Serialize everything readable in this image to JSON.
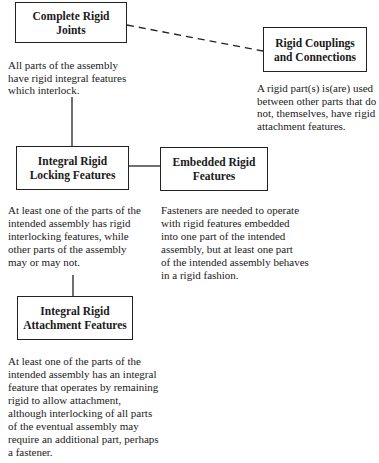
{
  "diagram": {
    "nodes": [
      {
        "id": "complete-rigid-joints",
        "title": "Complete Rigid\nJoints",
        "description": "All parts of the assembly\nhave rigid integral features\nwhich interlock."
      },
      {
        "id": "rigid-couplings-connections",
        "title": "Rigid Couplings\nand Connections",
        "description": "A rigid part(s) is(are) used\nbetween other parts that do\nnot, themselves, have rigid\nattachment features."
      },
      {
        "id": "integral-rigid-locking-features",
        "title": "Integral Rigid\nLocking Features",
        "description": "At least one of the parts of the\nintended assembly has rigid\ninterlocking features, while\nother parts of the assembly\nmay or may not."
      },
      {
        "id": "embedded-rigid-features",
        "title": "Embedded Rigid\nFeatures",
        "description": "Fasteners are needed to operate\nwith rigid features embedded\ninto one part of the intended\nassembly, but at least one part\nof the intended assembly behaves\nin a rigid fashion."
      },
      {
        "id": "integral-rigid-attachment-features",
        "title": "Integral Rigid\nAttachment Features",
        "description": "At least one of the parts of the\nintended assembly has an integral\nfeature that operates by remaining\nrigid to allow attachment,\nalthough interlocking of all parts\nof the eventual assembly may\nrequire an additional part, perhaps\na fastener."
      }
    ],
    "edges": [
      {
        "from": "complete-rigid-joints",
        "to": "rigid-couplings-connections",
        "style": "dashed"
      },
      {
        "from": "complete-rigid-joints",
        "to": "integral-rigid-locking-features",
        "style": "solid"
      },
      {
        "from": "integral-rigid-locking-features",
        "to": "embedded-rigid-features",
        "style": "solid"
      },
      {
        "from": "integral-rigid-locking-features",
        "to": "integral-rigid-attachment-features",
        "style": "solid"
      }
    ],
    "colors": {
      "line": "#222222",
      "text": "#1a1a1a",
      "background": "#ffffff"
    }
  }
}
